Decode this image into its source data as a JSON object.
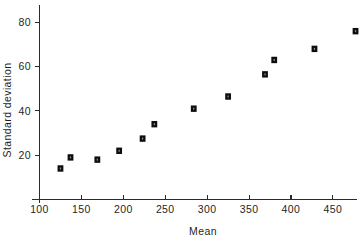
{
  "chart_data": {
    "type": "scatter",
    "title": "",
    "xlabel": "Mean",
    "ylabel": "Standard deviation",
    "xlim": [
      100,
      485
    ],
    "ylim": [
      0,
      86
    ],
    "xticks": [
      100,
      150,
      200,
      250,
      300,
      350,
      400,
      450
    ],
    "yticks": [
      20,
      40,
      60,
      80
    ],
    "grid": false,
    "legend": null,
    "marker": "filled-square",
    "x": [
      125,
      137,
      169,
      195,
      223,
      237,
      284,
      325,
      369,
      380,
      428,
      477
    ],
    "y": [
      14,
      19,
      18,
      22,
      27.5,
      34,
      41,
      46.5,
      56.5,
      63,
      68,
      76
    ],
    "points": [
      {
        "x": 125,
        "y": 14
      },
      {
        "x": 137,
        "y": 19
      },
      {
        "x": 169,
        "y": 18
      },
      {
        "x": 195,
        "y": 22
      },
      {
        "x": 223,
        "y": 27.5
      },
      {
        "x": 237,
        "y": 34
      },
      {
        "x": 284,
        "y": 41
      },
      {
        "x": 325,
        "y": 46.5
      },
      {
        "x": 369,
        "y": 56.5
      },
      {
        "x": 380,
        "y": 63
      },
      {
        "x": 428,
        "y": 68
      },
      {
        "x": 477,
        "y": 76
      }
    ]
  },
  "axes": {
    "x_tick_labels": [
      "100",
      "150",
      "200",
      "250",
      "300",
      "350",
      "400",
      "450"
    ],
    "y_tick_labels": [
      "20",
      "40",
      "60",
      "80"
    ],
    "x_title": "Mean",
    "y_title": "Standard deviation"
  },
  "colors": {
    "marker": "#0d0d0d",
    "axis": "#2b2b2b",
    "background": "#ffffff",
    "text": "#1f1f1f"
  }
}
